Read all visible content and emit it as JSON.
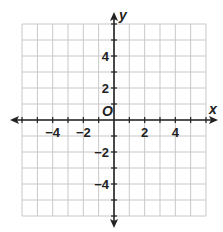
{
  "chart_data": {
    "type": "coordinate-plane",
    "title": "",
    "xlabel": "x",
    "ylabel": "y",
    "origin_label": "O",
    "xlim": [
      -6,
      6
    ],
    "ylim": [
      -6,
      6
    ],
    "grid": true,
    "grid_step": 1,
    "x_tick_labels": [
      {
        "value": -4,
        "label": "−4"
      },
      {
        "value": -2,
        "label": "−2"
      },
      {
        "value": 2,
        "label": "2"
      },
      {
        "value": 4,
        "label": "4"
      }
    ],
    "y_tick_labels": [
      {
        "value": 4,
        "label": "4"
      },
      {
        "value": 2,
        "label": "2"
      },
      {
        "value": -2,
        "label": "−2"
      },
      {
        "value": -4,
        "label": "−4"
      }
    ],
    "series": []
  },
  "colors": {
    "grid": "#c8c8c8",
    "axis": "#222222"
  }
}
